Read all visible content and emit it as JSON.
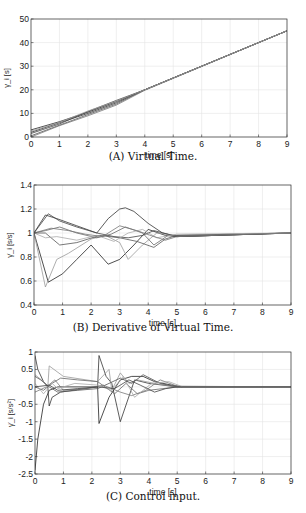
{
  "chart_data": [
    {
      "id": "A",
      "type": "line",
      "caption": "(A) Virtual Time.",
      "xlabel": "time [s]",
      "ylabel": "γ_i [s]",
      "xlim": [
        0,
        9
      ],
      "ylim": [
        0,
        50
      ],
      "xticks": [
        0,
        1,
        2,
        3,
        4,
        5,
        6,
        7,
        8,
        9
      ],
      "yticks": [
        0,
        10,
        20,
        30,
        40,
        50
      ],
      "grid": true,
      "box": {
        "x": 31,
        "y": 19,
        "w": 256,
        "h": 118
      },
      "series": [
        {
          "name": "agent1",
          "color": "#222",
          "x": [
            0,
            1,
            2,
            3,
            4,
            9
          ],
          "y": [
            3,
            6.5,
            10.5,
            15,
            20,
            45
          ]
        },
        {
          "name": "agent2",
          "color": "#333",
          "x": [
            0,
            1,
            2,
            3,
            4,
            9
          ],
          "y": [
            2,
            6,
            10,
            14.5,
            20,
            45
          ]
        },
        {
          "name": "agent3",
          "color": "#444",
          "x": [
            0,
            1,
            2,
            3,
            4,
            9
          ],
          "y": [
            1.5,
            5.5,
            10.8,
            15.5,
            20,
            45
          ]
        },
        {
          "name": "agent4",
          "color": "#555",
          "x": [
            0,
            1,
            2,
            3,
            4,
            9
          ],
          "y": [
            0.5,
            5,
            9.5,
            14,
            20,
            45
          ]
        },
        {
          "name": "agent5",
          "color": "#777",
          "x": [
            0,
            1,
            2,
            3,
            4,
            9
          ],
          "y": [
            0,
            4.8,
            9,
            13.5,
            19.8,
            45
          ]
        },
        {
          "name": "agent6",
          "color": "#999",
          "x": [
            0,
            1,
            2,
            3,
            4,
            9
          ],
          "y": [
            2.5,
            6.2,
            11,
            15.2,
            20,
            45
          ]
        }
      ]
    },
    {
      "id": "B",
      "type": "line",
      "caption": "(B) Derivative of Virtual Time.",
      "xlabel": "time [s]",
      "ylabel": "γ̇_i [s/s]",
      "xlim": [
        0,
        9
      ],
      "ylim": [
        0.4,
        1.4
      ],
      "xticks": [
        0,
        1,
        2,
        3,
        4,
        5,
        6,
        7,
        8,
        9
      ],
      "yticks": [
        0.4,
        0.6,
        0.8,
        1,
        1.2,
        1.4
      ],
      "ytick_labels": [
        "0.4",
        "0.6",
        "0.8",
        "1",
        "1.2",
        "1.4"
      ],
      "grid": true,
      "box": {
        "x": 34,
        "y": 185,
        "w": 257,
        "h": 120
      },
      "series": [
        {
          "name": "agent1",
          "color": "#333",
          "x": [
            0,
            0.4,
            0.8,
            1.5,
            2.2,
            2.6,
            3,
            3.2,
            3.5,
            4,
            4.5,
            5,
            9
          ],
          "y": [
            1,
            1.15,
            1.12,
            1.06,
            1,
            1.12,
            1.2,
            1.21,
            1.18,
            1.08,
            1.0,
            0.97,
            1.0
          ]
        },
        {
          "name": "agent2",
          "color": "#222",
          "x": [
            0,
            0.5,
            1,
            1.5,
            2,
            2.6,
            3,
            3.5,
            4,
            4.6,
            5,
            9
          ],
          "y": [
            1,
            0.59,
            0.66,
            0.78,
            0.9,
            0.74,
            0.78,
            0.9,
            1.03,
            0.98,
            0.97,
            1.0
          ]
        },
        {
          "name": "agent3",
          "color": "#999",
          "x": [
            0,
            0.4,
            0.8,
            1.2,
            2,
            2.5,
            3,
            3.3,
            3.8,
            4.3,
            5,
            9
          ],
          "y": [
            1,
            0.55,
            0.78,
            0.83,
            0.95,
            0.98,
            0.92,
            0.78,
            0.9,
            1.0,
            0.98,
            1.0
          ]
        },
        {
          "name": "agent4",
          "color": "#444",
          "x": [
            0,
            0.5,
            0.9,
            1.5,
            2.2,
            2.8,
            3.3,
            3.8,
            4.2,
            4.7,
            5,
            9
          ],
          "y": [
            1,
            1.16,
            1.1,
            1.05,
            1,
            0.97,
            0.96,
            0.98,
            1.02,
            0.99,
            0.97,
            1.0
          ]
        },
        {
          "name": "agent5",
          "color": "#666",
          "x": [
            0,
            0.4,
            0.9,
            1.5,
            2.2,
            2.7,
            3.2,
            3.8,
            4.2,
            4.7,
            5,
            9
          ],
          "y": [
            1,
            1.02,
            1.05,
            1.0,
            0.96,
            0.99,
            1.05,
            1.0,
            0.9,
            0.98,
            0.98,
            1.0
          ]
        },
        {
          "name": "agent6",
          "color": "#555",
          "x": [
            0,
            0.4,
            0.9,
            1.5,
            2.3,
            3,
            3.6,
            4.2,
            4.6,
            5,
            9
          ],
          "y": [
            1,
            1.0,
            0.9,
            0.92,
            0.98,
            0.96,
            0.93,
            0.88,
            0.95,
            0.98,
            1.0
          ]
        },
        {
          "name": "agent7",
          "color": "#aaa",
          "x": [
            0,
            0.4,
            0.8,
            1.5,
            2.2,
            2.8,
            3.3,
            3.8,
            4.3,
            5,
            9
          ],
          "y": [
            1,
            0.96,
            0.97,
            0.94,
            0.98,
            0.93,
            1.0,
            1.03,
            0.96,
            0.99,
            1.0
          ]
        },
        {
          "name": "agent8",
          "color": "#777",
          "x": [
            0,
            0.6,
            1.2,
            1.8,
            2.4,
            3,
            3.6,
            4.2,
            4.6,
            5,
            9
          ],
          "y": [
            1,
            1.04,
            1.02,
            0.99,
            0.97,
            1.06,
            1.02,
            0.97,
            0.94,
            0.97,
            1.0
          ]
        }
      ]
    },
    {
      "id": "C",
      "type": "line",
      "caption": "(C) Control input.",
      "xlabel": "time [s]",
      "ylabel": "γ̈_i [s/s²]",
      "xlim": [
        0,
        9
      ],
      "ylim": [
        -2.5,
        1
      ],
      "xticks": [
        0,
        1,
        2,
        3,
        4,
        5,
        6,
        7,
        8,
        9
      ],
      "yticks": [
        -2.5,
        -2,
        -1.5,
        -1,
        -0.5,
        0,
        0.5,
        1
      ],
      "ytick_labels": [
        "-2.5",
        "-2",
        "-1.5",
        "-1",
        "-0.5",
        "0",
        "0.5",
        "1"
      ],
      "grid": true,
      "box": {
        "x": 35,
        "y": 352,
        "w": 256,
        "h": 122
      },
      "series": [
        {
          "name": "agent1",
          "color": "#222",
          "x": [
            0,
            0.1,
            0.3,
            0.5,
            0.8,
            1.2,
            2.0,
            2.2,
            2.25,
            2.6,
            3,
            3.4,
            3.8,
            4.2,
            4.8,
            5.2,
            9
          ],
          "y": [
            -2.4,
            -1.5,
            -0.5,
            -0.1,
            0,
            0,
            0,
            0,
            -1.05,
            -0.3,
            0.2,
            0.3,
            0.3,
            0.15,
            0.05,
            0,
            0
          ]
        },
        {
          "name": "agent2",
          "color": "#333",
          "x": [
            0,
            0.1,
            0.3,
            0.45,
            0.5,
            0.6,
            0.9,
            2.2,
            2.25,
            2.5,
            2.7,
            3,
            3.5,
            4,
            5,
            9
          ],
          "y": [
            0.9,
            0.5,
            0.15,
            0,
            -0.55,
            -0.3,
            -0.15,
            0,
            0.9,
            0.3,
            0.1,
            -1.0,
            0.2,
            0.1,
            0,
            0
          ]
        },
        {
          "name": "agent3",
          "color": "#999",
          "x": [
            0,
            0.3,
            0.45,
            0.5,
            1.0,
            2.2,
            2.6,
            2.7,
            3.0,
            3.3,
            3.6,
            4.2,
            5,
            9
          ],
          "y": [
            0.35,
            0.15,
            0,
            0.6,
            0.3,
            0.15,
            0.5,
            -0.1,
            0.4,
            0.1,
            0.2,
            0.1,
            0,
            0
          ]
        },
        {
          "name": "agent4",
          "color": "#555",
          "x": [
            0,
            0.2,
            0.5,
            0.8,
            1.5,
            2.2,
            2.6,
            3,
            3.4,
            3.8,
            4.4,
            5,
            9
          ],
          "y": [
            0.3,
            0.2,
            0,
            -0.15,
            -0.1,
            -0.05,
            0.1,
            0.25,
            0.1,
            0.35,
            0.1,
            0,
            0
          ]
        },
        {
          "name": "agent5",
          "color": "#666",
          "x": [
            0,
            0.3,
            0.6,
            0.9,
            1.5,
            2.2,
            2.8,
            3.2,
            3.6,
            4.0,
            4.5,
            5,
            9
          ],
          "y": [
            0,
            -0.1,
            0.1,
            0.25,
            0.2,
            0.15,
            -0.2,
            0.1,
            -0.2,
            -0.1,
            -0.05,
            0,
            0
          ]
        },
        {
          "name": "agent6",
          "color": "#777",
          "x": [
            0,
            0.4,
            0.7,
            1,
            1.8,
            2.4,
            3,
            3.4,
            3.9,
            4.4,
            5,
            9
          ],
          "y": [
            -0.15,
            0,
            0.2,
            -0.1,
            -0.05,
            0.05,
            -0.15,
            -0.25,
            -0.1,
            0.2,
            0.02,
            0
          ]
        },
        {
          "name": "agent7",
          "color": "#aaa",
          "x": [
            0,
            0.3,
            0.6,
            0.8,
            1.4,
            2.2,
            2.7,
            3.1,
            3.5,
            4.1,
            4.7,
            5.2,
            9
          ],
          "y": [
            0.1,
            -0.2,
            0.1,
            -0.05,
            0.1,
            0.05,
            -0.1,
            0.3,
            -0.3,
            0.1,
            0.15,
            0,
            0
          ]
        },
        {
          "name": "agent8",
          "color": "#444",
          "x": [
            0,
            0.5,
            0.8,
            1.5,
            2.2,
            2.8,
            3.3,
            3.7,
            4.2,
            4.6,
            5,
            9
          ],
          "y": [
            0,
            0.05,
            -0.1,
            -0.05,
            0,
            -0.05,
            0.2,
            0.05,
            -0.15,
            -0.05,
            0,
            0
          ]
        }
      ]
    }
  ]
}
